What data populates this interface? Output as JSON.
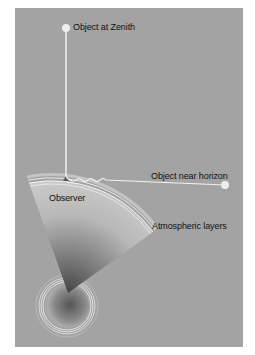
{
  "labels": {
    "zenith": "Object at Zenith",
    "horizon": "Object near horizon",
    "observer": "Observer",
    "atmosphere": "Atmospheric layers"
  },
  "colors": {
    "background": "#a3a3a3",
    "line": "#f2f2f2",
    "text": "#111111"
  }
}
